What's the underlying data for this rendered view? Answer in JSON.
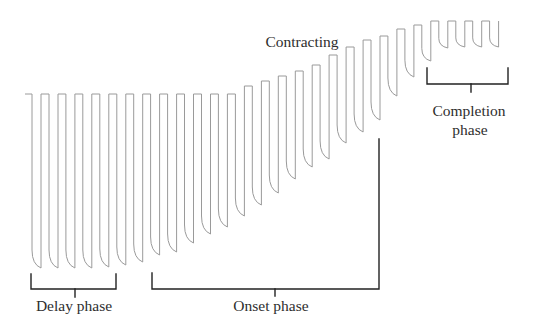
{
  "labels": {
    "contracting": "Contracting",
    "delay_phase": "Delay phase",
    "onset_phase": "Onset phase",
    "completion_phase_line1": "Completion",
    "completion_phase_line2": "phase"
  },
  "phases": [
    {
      "name": "delay",
      "label": "Delay phase",
      "pulses_covered": [
        0,
        4
      ]
    },
    {
      "name": "onset",
      "label": "Onset phase",
      "pulses_covered": [
        7,
        20
      ]
    },
    {
      "name": "completion",
      "label": "Completion phase",
      "pulses_covered": [
        24,
        27
      ]
    }
  ],
  "trace": {
    "start_x": 25,
    "first_drop_x": 32,
    "pitch": 16.95,
    "tip_dx": 9,
    "end_top": 21,
    "pulses": [
      {
        "top": 94,
        "tip": 268
      },
      {
        "top": 94,
        "tip": 268
      },
      {
        "top": 94,
        "tip": 268
      },
      {
        "top": 94,
        "tip": 268
      },
      {
        "top": 94,
        "tip": 267
      },
      {
        "top": 94,
        "tip": 265
      },
      {
        "top": 94,
        "tip": 262
      },
      {
        "top": 94,
        "tip": 255
      },
      {
        "top": 94,
        "tip": 252
      },
      {
        "top": 94,
        "tip": 243
      },
      {
        "top": 94,
        "tip": 234
      },
      {
        "top": 94,
        "tip": 227
      },
      {
        "top": 94,
        "tip": 216
      },
      {
        "top": 86,
        "tip": 205
      },
      {
        "top": 81,
        "tip": 193
      },
      {
        "top": 76,
        "tip": 179
      },
      {
        "top": 71,
        "tip": 167
      },
      {
        "top": 65,
        "tip": 159
      },
      {
        "top": 55,
        "tip": 143
      },
      {
        "top": 47,
        "tip": 132
      },
      {
        "top": 40,
        "tip": 120
      },
      {
        "top": 36,
        "tip": 96
      },
      {
        "top": 29,
        "tip": 77
      },
      {
        "top": 25,
        "tip": 61
      },
      {
        "top": 21,
        "tip": 48
      },
      {
        "top": 21,
        "tip": 47
      },
      {
        "top": 21,
        "tip": 47
      },
      {
        "top": 21,
        "tip": 47
      }
    ]
  },
  "colors": {
    "trace": "#9a9a9a",
    "bracket": "#222222",
    "text": "#2e2e2e"
  }
}
